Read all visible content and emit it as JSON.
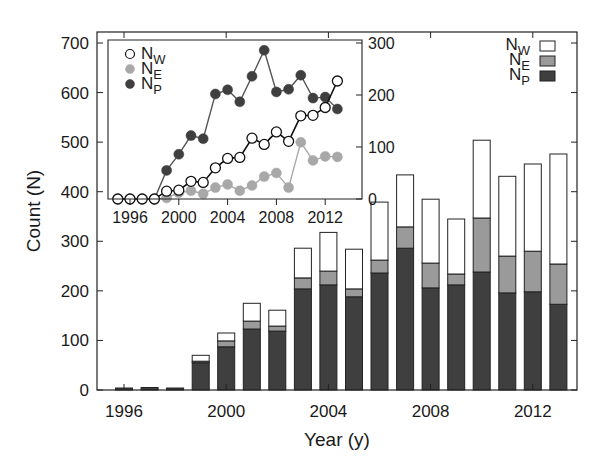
{
  "colors": {
    "W": "#ffffff",
    "E": "#9a9a9a",
    "P": "#3f3f3f",
    "line_W": "#111111",
    "line_E": "#a8a8a8",
    "line_P": "#555555",
    "axis": "#222222"
  },
  "chart_data": [
    {
      "type": "bar",
      "stacked": true,
      "title": "",
      "xlabel": "Year (y)",
      "ylabel": "Count (N)",
      "ylim": [
        0,
        700
      ],
      "yticks": [
        0,
        100,
        200,
        300,
        400,
        500,
        600,
        700
      ],
      "xticks": [
        1996,
        2000,
        2004,
        2008,
        2012
      ],
      "categories": [
        1996,
        1997,
        1998,
        1999,
        2000,
        2001,
        2002,
        2003,
        2004,
        2005,
        2006,
        2007,
        2008,
        2009,
        2010,
        2011,
        2012,
        2013
      ],
      "series": [
        {
          "name": "N_P",
          "label": "N",
          "sub": "P",
          "values": [
            4,
            5,
            4,
            55,
            87,
            123,
            119,
            204,
            212,
            188,
            236,
            286,
            206,
            212,
            238,
            196,
            198,
            173
          ]
        },
        {
          "name": "N_E",
          "label": "N",
          "sub": "E",
          "values": [
            0,
            0,
            0,
            3,
            12,
            16,
            10,
            22,
            28,
            16,
            26,
            43,
            50,
            22,
            109,
            74,
            82,
            81
          ]
        },
        {
          "name": "N_W",
          "label": "N",
          "sub": "W",
          "values": [
            0,
            0,
            0,
            12,
            16,
            36,
            32,
            60,
            78,
            80,
            117,
            105,
            129,
            111,
            157,
            161,
            176,
            222
          ]
        }
      ],
      "legend": {
        "position": "upper right",
        "entries": [
          "N_W",
          "N_E",
          "N_P"
        ]
      },
      "grid": false
    },
    {
      "type": "line",
      "inset": true,
      "xlabel": "",
      "ylabel": "",
      "ylim": [
        0,
        300
      ],
      "yticks": [
        0,
        100,
        200,
        300
      ],
      "yaxis_side": "right",
      "xticks": [
        1996,
        2000,
        2004,
        2008,
        2012
      ],
      "x": [
        1995,
        1996,
        1997,
        1998,
        1999,
        2000,
        2001,
        2002,
        2003,
        2004,
        2005,
        2006,
        2007,
        2008,
        2009,
        2010,
        2011,
        2012,
        2013
      ],
      "series": [
        {
          "name": "N_W",
          "label": "N",
          "sub": "W",
          "marker": "open-circle",
          "values": [
            0,
            0,
            0,
            0,
            15,
            17,
            34,
            32,
            60,
            78,
            80,
            117,
            105,
            129,
            111,
            160,
            161,
            176,
            227
          ]
        },
        {
          "name": "N_E",
          "label": "N",
          "sub": "E",
          "marker": "filled-circle-light",
          "values": [
            0,
            0,
            0,
            0,
            2,
            12,
            16,
            10,
            22,
            28,
            16,
            26,
            43,
            50,
            22,
            109,
            74,
            82,
            81
          ]
        },
        {
          "name": "N_P",
          "label": "N",
          "sub": "P",
          "marker": "filled-circle-dark",
          "values": [
            0,
            0,
            0,
            0,
            55,
            86,
            122,
            116,
            202,
            210,
            187,
            236,
            286,
            206,
            211,
            238,
            194,
            196,
            173
          ]
        }
      ],
      "legend": {
        "position": "upper left",
        "entries": [
          "N_W",
          "N_E",
          "N_P"
        ]
      },
      "grid": false
    }
  ]
}
